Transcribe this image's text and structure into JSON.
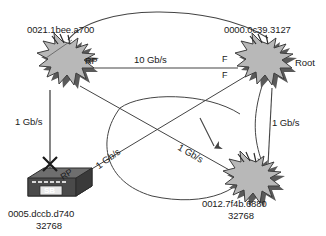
{
  "diagram": {
    "type": "network-topology",
    "background_color": "#ffffff",
    "node_fill": "#b3b3b3",
    "node_stroke": "#4d4d4d",
    "line_color": "#444444"
  },
  "nodes": [
    {
      "id": "sw-top-left",
      "shape": "starburst",
      "mac": "0021.1bee.a700",
      "priority": "",
      "role_label": "RP",
      "role_name": "root-port",
      "position": "top-left"
    },
    {
      "id": "sw-root",
      "shape": "starburst",
      "mac": "0000.0c39.3127",
      "priority": "",
      "role_label": "Root",
      "role_name": "root-bridge",
      "port_labels": [
        "F",
        "F"
      ],
      "position": "top-right"
    },
    {
      "id": "sw-bottom-left",
      "shape": "switch-box",
      "device_label": "SB",
      "mac": "0005.dccb.d740",
      "priority": "32768",
      "role_label": "RP",
      "role_name": "root-port",
      "blocked": true,
      "position": "bottom-left"
    },
    {
      "id": "sw-bottom-right",
      "shape": "starburst",
      "mac": "0012.7f4b.6880",
      "priority": "32768",
      "role_label": "",
      "position": "bottom-right"
    }
  ],
  "links": [
    {
      "id": "link-top",
      "label": "10 Gb/s",
      "from": "sw-top-left",
      "to": "sw-root"
    },
    {
      "id": "link-left",
      "label": "1 Gb/s",
      "from": "sw-top-left",
      "to": "sw-bottom-left"
    },
    {
      "id": "link-right",
      "label": "1 Gb/s",
      "from": "sw-root",
      "to": "sw-bottom-right"
    },
    {
      "id": "link-diag-a",
      "label": "1 Gb/s",
      "from": "sw-bottom-left",
      "to": "sw-root"
    },
    {
      "id": "link-diag-b",
      "label": "1 Gb/s",
      "from": "sw-top-left",
      "to": "sw-bottom-right"
    }
  ],
  "markers": {
    "blocked_port": "X",
    "blocked_port_name": "blocked-port-marker"
  }
}
